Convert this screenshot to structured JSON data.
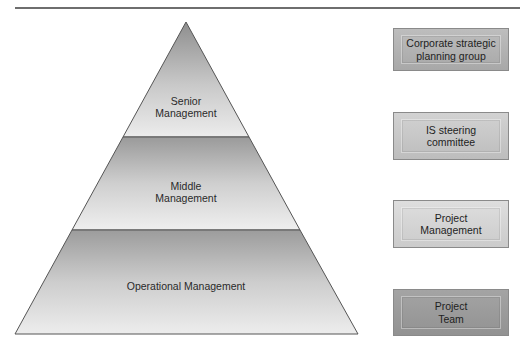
{
  "diagram": {
    "type": "pyramid-with-levels",
    "pyramid": {
      "tiers": [
        {
          "id": "senior",
          "label": "Senior\nManagement"
        },
        {
          "id": "middle",
          "label": "Middle\nManagement"
        },
        {
          "id": "operational",
          "label": "Operational Management"
        }
      ]
    },
    "boxes": [
      {
        "id": "corporate",
        "label": "Corporate strategic\nplanning group",
        "color": "#b0b0b0"
      },
      {
        "id": "is-steering",
        "label": "IS steering\ncommittee",
        "color": "#c4c4c4"
      },
      {
        "id": "project-mgmt",
        "label": "Project\nManagement",
        "color": "#d4d4d4"
      },
      {
        "id": "project-team",
        "label": "Project\nTeam",
        "color": "#9a9a9a"
      }
    ]
  },
  "colors": {
    "outline": "#555555",
    "rule": "#6e6e6e"
  }
}
